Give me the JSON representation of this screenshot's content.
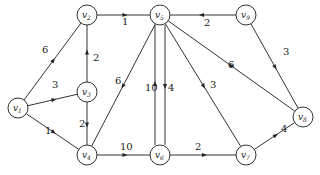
{
  "diagram": {
    "type": "directed-weighted-graph",
    "nodes": [
      {
        "id": "v1",
        "label": "v1",
        "x": 18,
        "y": 108
      },
      {
        "id": "v2",
        "label": "v2",
        "x": 87,
        "y": 15
      },
      {
        "id": "v3",
        "label": "v3",
        "x": 87,
        "y": 92
      },
      {
        "id": "v4",
        "label": "v4",
        "x": 87,
        "y": 155
      },
      {
        "id": "v5",
        "label": "v5",
        "x": 160,
        "y": 15
      },
      {
        "id": "v6",
        "label": "v6",
        "x": 160,
        "y": 155
      },
      {
        "id": "v7",
        "label": "v7",
        "x": 246,
        "y": 155
      },
      {
        "id": "v8",
        "label": "v8",
        "x": 303,
        "y": 117
      },
      {
        "id": "v9",
        "label": "v9",
        "x": 246,
        "y": 15
      }
    ],
    "edges": [
      {
        "from": "v1",
        "to": "v2",
        "weight": "6",
        "lx": 42,
        "ly": 53
      },
      {
        "from": "v1",
        "to": "v3",
        "weight": "3",
        "lx": 52,
        "ly": 88
      },
      {
        "from": "v1",
        "to": "v4",
        "weight": "1",
        "lx": 45,
        "ly": 134
      },
      {
        "from": "v3",
        "to": "v2",
        "weight": "2",
        "lx": 93,
        "ly": 61
      },
      {
        "from": "v3",
        "to": "v4",
        "weight": "2",
        "lx": 79,
        "ly": 127
      },
      {
        "from": "v2",
        "to": "v5",
        "weight": "1",
        "lx": 122,
        "ly": 25
      },
      {
        "from": "v5",
        "to": "v4",
        "weight": "6",
        "lx": 115,
        "ly": 84
      },
      {
        "from": "v4",
        "to": "v6",
        "weight": "10",
        "lx": 120,
        "ly": 150
      },
      {
        "from": "v6",
        "to": "v5",
        "weight": "10",
        "lx": 145,
        "ly": 91
      },
      {
        "from": "v5",
        "to": "v6",
        "weight": "4",
        "lx": 168,
        "ly": 91
      },
      {
        "from": "v9",
        "to": "v5",
        "weight": "2",
        "lx": 204,
        "ly": 26
      },
      {
        "from": "v9",
        "to": "v8",
        "weight": "3",
        "lx": 283,
        "ly": 55
      },
      {
        "from": "v8",
        "to": "v5",
        "weight": "6",
        "lx": 228,
        "ly": 68
      },
      {
        "from": "v5",
        "to": "v7",
        "weight": "3",
        "lx": 210,
        "ly": 88
      },
      {
        "from": "v6",
        "to": "v7",
        "weight": "2",
        "lx": 195,
        "ly": 150
      },
      {
        "from": "v7",
        "to": "v8",
        "weight": "4",
        "lx": 281,
        "ly": 132
      }
    ]
  }
}
